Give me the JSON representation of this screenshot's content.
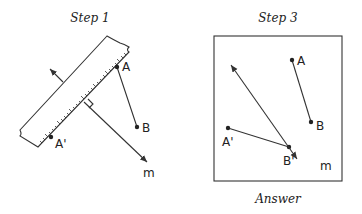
{
  "panels": [
    {
      "title": "Step 1",
      "points": {
        "A": "A",
        "B": "B",
        "A_prime": "A'"
      },
      "line_label": "m"
    },
    {
      "title": "Step 3",
      "points": {
        "A": "A",
        "B": "B",
        "A_prime": "A'",
        "B_prime": "B'"
      },
      "line_label": "m",
      "caption": "Answer"
    }
  ]
}
